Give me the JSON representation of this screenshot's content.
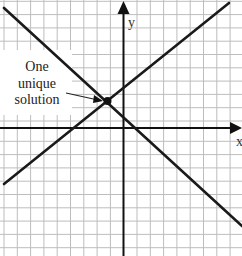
{
  "diagram": {
    "axes": {
      "x_label": "x",
      "y_label": "y"
    },
    "annotation": {
      "lines": [
        "One",
        "unique",
        "solution"
      ]
    },
    "lines": [
      {
        "name": "decreasing-line",
        "slope_sign": "negative"
      },
      {
        "name": "increasing-line",
        "slope_sign": "positive"
      }
    ],
    "intersection": {
      "label": "One unique solution"
    },
    "colors": {
      "grid": "#bdbdbd",
      "axis": "#111111",
      "line": "#1a1a1a",
      "background": "#ffffff"
    }
  }
}
